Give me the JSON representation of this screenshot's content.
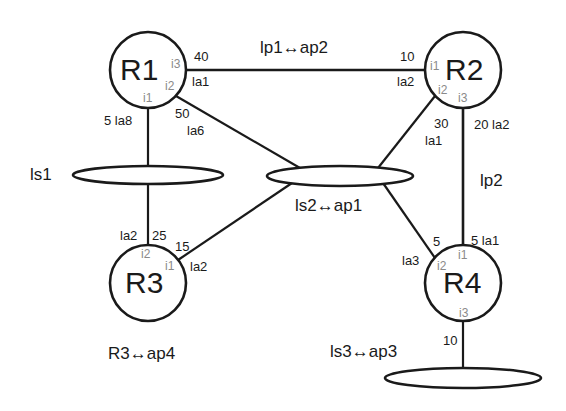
{
  "diagram": {
    "type": "network-topology",
    "colors": {
      "line": "#1a1a1a",
      "text": "#1a1a1a",
      "interface": "#8a8a8a",
      "background": "#ffffff"
    },
    "routers": [
      {
        "id": "R1",
        "label": "R1",
        "interfaces": [
          "i1",
          "i2",
          "i3"
        ]
      },
      {
        "id": "R2",
        "label": "R2",
        "interfaces": [
          "i1",
          "i2",
          "i3"
        ]
      },
      {
        "id": "R3",
        "label": "R3",
        "interfaces": [
          "i1",
          "i2"
        ]
      },
      {
        "id": "R4",
        "label": "R4",
        "interfaces": [
          "i1",
          "i2",
          "i3"
        ]
      }
    ],
    "segments": [
      {
        "id": "ls1",
        "label": "ls1"
      },
      {
        "id": "ls2",
        "label": "ls2↔ap1"
      },
      {
        "id": "ls3",
        "label": "ls3↔ap3"
      }
    ],
    "links": [
      {
        "label": "lp1↔ap2",
        "a": "R1.i3",
        "b": "R2.i1",
        "a_cost": "40",
        "a_addr": "la1",
        "b_cost": "10",
        "b_addr": "la2"
      },
      {
        "label": "lp2",
        "a": "R2.i3",
        "b": "R4.i1",
        "a_cost": "20",
        "a_addr": "la2",
        "b_cost": "5",
        "b_addr": "la1"
      },
      {
        "a": "R1.i1",
        "b": "ls1",
        "cost": "5",
        "addr": "la8"
      },
      {
        "a": "R3.i2",
        "b": "ls1",
        "cost": "25",
        "addr": "la2"
      },
      {
        "a": "R1.i2",
        "b": "ls2",
        "cost": "50",
        "addr": "la6"
      },
      {
        "a": "R2.i2",
        "b": "ls2",
        "cost": "30",
        "addr": "la1"
      },
      {
        "a": "R3.i1",
        "b": "ls2",
        "cost": "15",
        "addr": "la2"
      },
      {
        "a": "R4.i2",
        "b": "ls2",
        "cost": "5",
        "addr": "la3"
      },
      {
        "a": "R4.i3",
        "b": "ls3",
        "cost": "10"
      }
    ],
    "annotations": {
      "r3": "R3↔ap4"
    }
  },
  "labels": {
    "r1": "R1",
    "r2": "R2",
    "r3": "R3",
    "r4": "R4",
    "i1": "i1",
    "i2": "i2",
    "i3": "i3",
    "ls1": "ls1",
    "ls2": "ls2↔ap1",
    "ls3": "ls3↔ap3",
    "lp1": "lp1↔ap2",
    "lp2": "lp2",
    "r3ap4": "R3↔ap4",
    "r1_i3_cost": "40",
    "r1_i3_addr": "la1",
    "r2_i1_cost": "10",
    "r2_i1_addr": "la2",
    "r1_i1_costaddr": "5 la8",
    "r1_i2_cost": "50",
    "r1_i2_addr": "la6",
    "r2_i2_cost": "30",
    "r2_i2_addr": "la1",
    "r2_i3_costaddr": "20 la2",
    "r3_i2_addr": "la2",
    "r3_i2_cost": "25",
    "r3_i1_cost": "15",
    "r3_i1_addr": "la2",
    "r4_i2_cost": "5",
    "r4_i2_addr": "la3",
    "r4_i1_costaddr": "5 la1",
    "r4_i3_cost": "10"
  }
}
